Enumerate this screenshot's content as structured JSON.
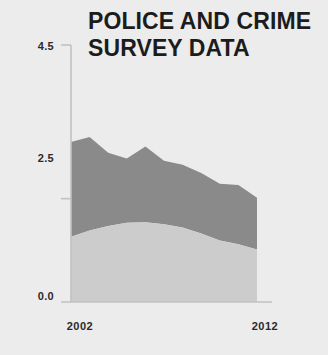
{
  "chart_data": {
    "type": "area",
    "title": "POLICE AND CRIME SURVEY DATA",
    "title_line1": "POLICE AND CRIME",
    "title_line2": "SURVEY DATA",
    "stacked": true,
    "xlabel": "",
    "ylabel": "",
    "grid": false,
    "legend": "none",
    "background_color": "#ececec",
    "text_color": "#1c1c1c",
    "axis_color": "#c2c2c2",
    "x": [
      2002,
      2003,
      2004,
      2005,
      2006,
      2007,
      2008,
      2009,
      2010,
      2011,
      2012
    ],
    "x_tick_labels": [
      "2002",
      "2012"
    ],
    "x_tick_values": [
      2002,
      2012
    ],
    "xlim": [
      2002,
      2012
    ],
    "y_tick_labels": [
      "4.5",
      "2.5",
      "0.0"
    ],
    "y_tick_values": [
      4.5,
      2.5,
      0.0
    ],
    "ylim": [
      0.0,
      4.5
    ],
    "series": [
      {
        "name": "lower-band",
        "color": "#cccccc",
        "values": [
          1.58,
          1.73,
          1.84,
          1.92,
          1.93,
          1.88,
          1.8,
          1.66,
          1.49,
          1.4,
          1.27
        ]
      },
      {
        "name": "upper-band",
        "color": "#8a8a8a",
        "values": [
          2.29,
          2.26,
          1.77,
          1.55,
          1.83,
          1.54,
          1.52,
          1.46,
          1.37,
          1.43,
          1.25
        ]
      }
    ],
    "totals": [
      3.87,
      3.99,
      3.61,
      3.47,
      3.76,
      3.42,
      3.32,
      3.12,
      2.86,
      2.83,
      2.52
    ]
  }
}
